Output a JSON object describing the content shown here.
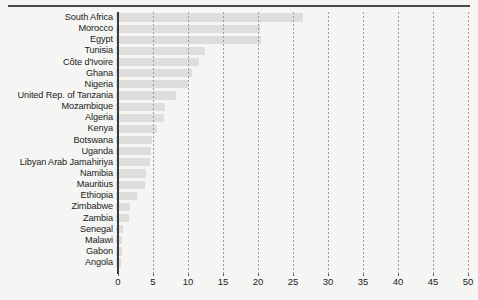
{
  "chart_data": {
    "type": "bar",
    "orientation": "horizontal",
    "title": "",
    "subtitle": "",
    "xlabel": "",
    "ylabel": "",
    "xlim": [
      0,
      50
    ],
    "ylim": null,
    "grid": true,
    "grid_style": "dashed-vertical",
    "legend": null,
    "legend_position": "none",
    "xticks": [
      0,
      5,
      10,
      15,
      20,
      25,
      30,
      35,
      40,
      45,
      50
    ],
    "xtick_labels": [
      "0",
      "5",
      "10",
      "15",
      "20",
      "25",
      "30",
      "35",
      "40",
      "45",
      "50"
    ],
    "categories": [
      "South Africa",
      "Morocco",
      "Egypt",
      "Tunisia",
      "Côte d'Ivoire",
      "Ghana",
      "Nigeria",
      "United Rep. of Tanzania",
      "Mozambique",
      "Algeria",
      "Kenya",
      "Botswana",
      "Uganda",
      "Libyan Arab Jamahiriya",
      "Namibia",
      "Mauritius",
      "Ethiopia",
      "Zimbabwe",
      "Zambia",
      "Senegal",
      "Malawi",
      "Gabon",
      "Angola"
    ],
    "values": [
      26.7,
      20.6,
      20.7,
      12.7,
      11.9,
      10.8,
      10.3,
      8.5,
      7.0,
      6.8,
      5.8,
      5.1,
      5.0,
      4.9,
      4.3,
      4.2,
      3.0,
      2.0,
      1.9,
      1.0,
      0.9,
      0.8,
      0.7
    ],
    "colors": {
      "bar": "#dddddd",
      "axis": "#3a3a3a",
      "grid": "#9a9a9a",
      "text": "#1b1b1b",
      "background": "#f5f5f3",
      "top_rule": "#4a4a4a"
    }
  }
}
